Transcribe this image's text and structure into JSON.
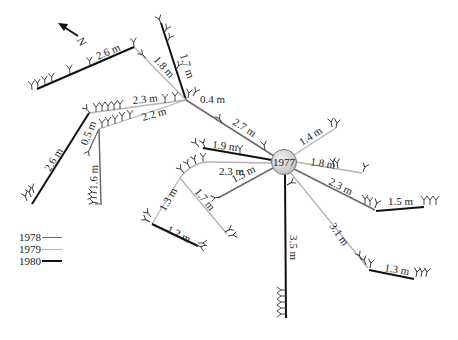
{
  "diagram": {
    "north_arrow": {
      "label": "N"
    },
    "origin": {
      "label": "1977"
    },
    "year_colors": {
      "1978": "#6a6a6a",
      "1979": "#b4b4b4",
      "1980": "#111111"
    },
    "segments": [
      {
        "id": "s1",
        "label": "2.7 m",
        "year": "1978"
      },
      {
        "id": "s2",
        "label": "1.7 m",
        "year": "1980"
      },
      {
        "id": "s3",
        "label": "0.4 m",
        "year": "1980"
      },
      {
        "id": "s4",
        "label": "1.8 m",
        "year": "1979"
      },
      {
        "id": "s5",
        "label": "2.6 m",
        "year": "1980"
      },
      {
        "id": "s6",
        "label": "2.3 m",
        "year": "1979"
      },
      {
        "id": "s7",
        "label": "2.2 m",
        "year": "1979"
      },
      {
        "id": "s8",
        "label": "2.6 m",
        "year": "1980"
      },
      {
        "id": "s9",
        "label": "0.5 m",
        "year": "1978"
      },
      {
        "id": "s10",
        "label": "1.6 m",
        "year": "1978"
      },
      {
        "id": "s11",
        "label": "1.9 m",
        "year": "1980"
      },
      {
        "id": "s12",
        "label": "2.3 m",
        "year": "1979"
      },
      {
        "id": "s13",
        "label": "1.5 m",
        "year": "1978"
      },
      {
        "id": "s14",
        "label": "1.3 m",
        "year": "1979"
      },
      {
        "id": "s15",
        "label": "1.7 m",
        "year": "1979"
      },
      {
        "id": "s16",
        "label": "1.2 m",
        "year": "1980"
      },
      {
        "id": "s17",
        "label": "1.4 m",
        "year": "1979"
      },
      {
        "id": "s18",
        "label": "1.8 m",
        "year": "1979"
      },
      {
        "id": "s19",
        "label": "2.3 m",
        "year": "1978"
      },
      {
        "id": "s20",
        "label": "1.5 m",
        "year": "1980"
      },
      {
        "id": "s21",
        "label": "3.1 m",
        "year": "1979"
      },
      {
        "id": "s22",
        "label": "1.3 m",
        "year": "1980"
      },
      {
        "id": "s23",
        "label": "3.5 m",
        "year": "1980"
      }
    ]
  },
  "legend": {
    "items": [
      {
        "label": "1978",
        "color": "#6a6a6a",
        "width": 1.5
      },
      {
        "label": "1979",
        "color": "#b4b4b4",
        "width": 1.2
      },
      {
        "label": "1980",
        "color": "#111111",
        "width": 2.2
      }
    ]
  }
}
